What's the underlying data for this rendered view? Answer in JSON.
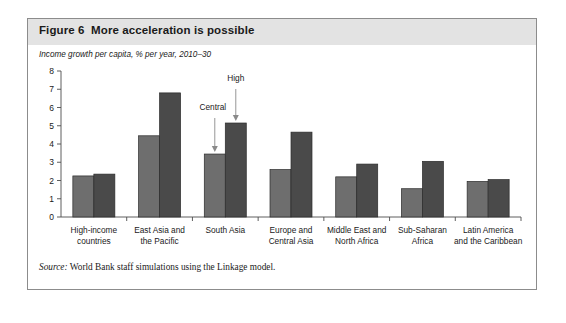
{
  "figure": {
    "title": "Figure 6  More acceleration is possible",
    "subtitle": "Income growth per capita, % per year, 2010–30",
    "source_prefix": "Source:",
    "source_text": " World Bank staff simulations using the Linkage model."
  },
  "colors": {
    "title_band": "#e3e3e3",
    "card_border": "#8c8c8c",
    "bar_central": "#6e6e6e",
    "bar_high": "#4a4a4a",
    "axis": "#4d4d4d",
    "annotation_arrow": "#8a8a8a"
  },
  "annotations": [
    {
      "label": "Central",
      "target_group": "South Asia",
      "target_series": "Central"
    },
    {
      "label": "High",
      "target_group": "South Asia",
      "target_series": "High"
    }
  ],
  "chart_data": {
    "type": "bar",
    "title": "Figure 6  More acceleration is possible",
    "subtitle": "Income growth per capita, % per year, 2010–30",
    "xlabel": "",
    "ylabel": "",
    "ylim": [
      0,
      8
    ],
    "yticks": [
      0,
      1,
      2,
      3,
      4,
      5,
      6,
      7,
      8
    ],
    "ytick_labels": [
      "0",
      "1",
      "2",
      "3",
      "4",
      "5",
      "6",
      "7",
      "8"
    ],
    "grid": false,
    "legend": "none",
    "categories": [
      "High-income countries",
      "East Asia and the Pacific",
      "South Asia",
      "Europe and Central Asia",
      "Middle East and North Africa",
      "Sub-Saharan Africa",
      "Latin America and the Caribbean"
    ],
    "category_label_lines": [
      [
        "High-income",
        "countries"
      ],
      [
        "East Asia and",
        "the Pacific"
      ],
      [
        "South Asia",
        ""
      ],
      [
        "Europe and",
        "Central Asia"
      ],
      [
        "Middle East and",
        "North Africa"
      ],
      [
        "Sub-Saharan",
        "Africa"
      ],
      [
        "Latin America",
        "and the Caribbean"
      ]
    ],
    "series": [
      {
        "name": "Central",
        "values": [
          2.25,
          4.45,
          3.45,
          2.6,
          2.2,
          1.55,
          1.95
        ]
      },
      {
        "name": "High",
        "values": [
          2.35,
          6.8,
          5.15,
          4.65,
          2.9,
          3.05,
          2.05
        ]
      }
    ]
  }
}
